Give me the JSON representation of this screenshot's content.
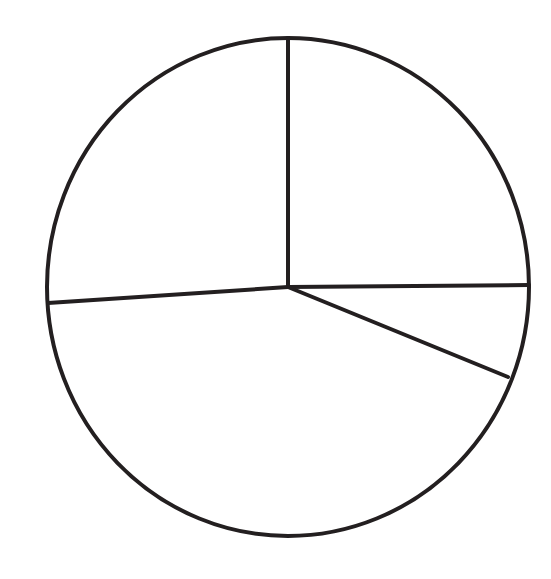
{
  "figure": {
    "kind": "pie-chart-outline",
    "background_color": "#ffffff",
    "stroke_color": "#231f20",
    "title": "",
    "caption": "",
    "labels_visible": false
  },
  "chart_data": {
    "type": "pie",
    "title": "",
    "xlabel": "",
    "ylabel": "",
    "legend": [],
    "legend_position": "none",
    "grid": false,
    "labels_shown": false,
    "values_shown": false,
    "units": "degrees",
    "total_degrees": 360,
    "categories": [
      "Sector 1",
      "Sector 2",
      "Sector 3",
      "Sector 4"
    ],
    "values": [
      88,
      21,
      153,
      98
    ],
    "fractions": [
      0.244,
      0.058,
      0.425,
      0.272
    ],
    "slice_fills": [
      "#ffffff",
      "#ffffff",
      "#ffffff",
      "#ffffff"
    ],
    "slices": [
      {
        "name": "Sector 1",
        "label": "",
        "start_angle_deg": 90,
        "end_angle_deg": 1.5,
        "sweep_deg": 88.5,
        "fraction": 0.246,
        "fill": "#ffffff",
        "position": "top-right"
      },
      {
        "name": "Sector 2",
        "label": "",
        "start_angle_deg": 1.5,
        "end_angle_deg": -21.5,
        "sweep_deg": 23,
        "fraction": 0.064,
        "fill": "#ffffff",
        "position": "right"
      },
      {
        "name": "Sector 3",
        "label": "",
        "start_angle_deg": -21.5,
        "end_angle_deg": -176,
        "sweep_deg": 154.5,
        "fraction": 0.429,
        "fill": "#ffffff",
        "position": "bottom"
      },
      {
        "name": "Sector 4",
        "label": "",
        "start_angle_deg": 184,
        "end_angle_deg": 90,
        "sweep_deg": 94,
        "fraction": 0.261,
        "fill": "#ffffff",
        "position": "top-left"
      }
    ],
    "geometry": {
      "center_x": 288,
      "center_y": 287,
      "radius_x": 241,
      "radius_y": 249,
      "circle_stroke_width": 4,
      "radius_stroke_width": 4,
      "radius_endpoints": [
        {
          "name": "up",
          "x": 288,
          "y": 38
        },
        {
          "name": "right",
          "x": 529,
          "y": 285
        },
        {
          "name": "down-right",
          "x": 508,
          "y": 377
        },
        {
          "name": "left",
          "x": 48,
          "y": 303
        }
      ]
    }
  }
}
